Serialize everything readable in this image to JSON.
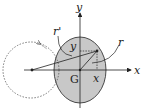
{
  "diagram": {
    "labels": {
      "x_axis": "x",
      "y_axis": "y",
      "centroid": "G",
      "radius": "r",
      "radius_prime": "r'",
      "x_component": "x",
      "y_component": "y"
    },
    "colors": {
      "ellipse_fill": "#c8c8c8",
      "stroke": "#222222",
      "background": "#ffffff"
    }
  }
}
